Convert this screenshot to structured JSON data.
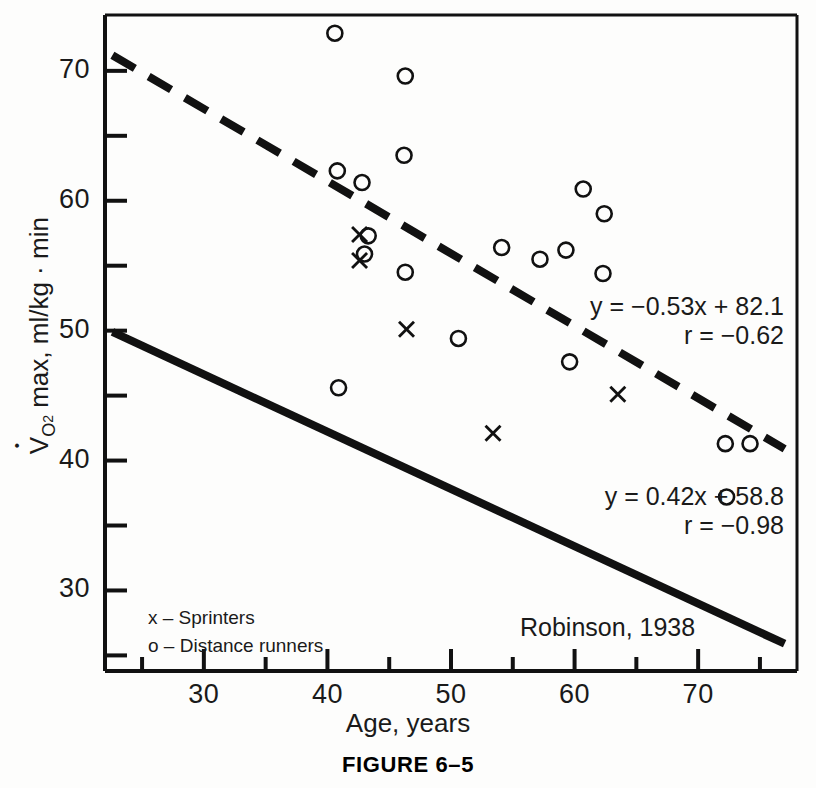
{
  "figure": {
    "caption": "FIGURE 6–5",
    "citation": "Robinson, 1938"
  },
  "chart_data": {
    "type": "scatter",
    "title": "",
    "xlabel": "Age, years",
    "ylabel": "V̇O2 max, ml/kg · min",
    "ylabel_parts": {
      "v": "V",
      "o2_sub": "O",
      "o2_sub_num": "2",
      "rest": " max, ml/kg · min"
    },
    "xlim": [
      22,
      78
    ],
    "ylim": [
      23.8,
      74.3
    ],
    "grid": false,
    "x_ticks_major": [
      30,
      40,
      50,
      60,
      70
    ],
    "x_ticks_minor": [
      25,
      35,
      45,
      55,
      65,
      75
    ],
    "x_tick_labels": [
      "30",
      "40",
      "50",
      "60",
      "70"
    ],
    "y_ticks_major": [
      30,
      40,
      50,
      60,
      70
    ],
    "y_ticks_minor": [
      25,
      35,
      45,
      55,
      65
    ],
    "y_tick_labels": [
      "30",
      "40",
      "50",
      "60",
      "70"
    ],
    "legend_position": "lower-left",
    "series": [
      {
        "name": "Sprinters",
        "marker": "x",
        "legend_label": "x – Sprinters",
        "points": [
          {
            "x": 42.6,
            "y": 57.4
          },
          {
            "x": 42.6,
            "y": 55.4
          },
          {
            "x": 46.4,
            "y": 50.1
          },
          {
            "x": 53.4,
            "y": 42.1
          },
          {
            "x": 63.5,
            "y": 45.1
          }
        ]
      },
      {
        "name": "Distance runners",
        "marker": "o",
        "legend_label": "o – Distance runners",
        "points": [
          {
            "x": 40.6,
            "y": 72.9
          },
          {
            "x": 46.3,
            "y": 69.6
          },
          {
            "x": 46.2,
            "y": 63.5
          },
          {
            "x": 40.8,
            "y": 62.3
          },
          {
            "x": 42.8,
            "y": 61.4
          },
          {
            "x": 43.3,
            "y": 57.3
          },
          {
            "x": 43.0,
            "y": 55.9
          },
          {
            "x": 46.3,
            "y": 54.5
          },
          {
            "x": 50.6,
            "y": 49.4
          },
          {
            "x": 54.1,
            "y": 56.4
          },
          {
            "x": 57.2,
            "y": 55.5
          },
          {
            "x": 59.3,
            "y": 56.2
          },
          {
            "x": 60.7,
            "y": 60.9
          },
          {
            "x": 62.4,
            "y": 59.0
          },
          {
            "x": 62.3,
            "y": 54.4
          },
          {
            "x": 59.6,
            "y": 47.6
          },
          {
            "x": 40.9,
            "y": 45.6
          },
          {
            "x": 72.2,
            "y": 41.3
          },
          {
            "x": 74.2,
            "y": 41.3
          },
          {
            "x": 72.3,
            "y": 37.2
          }
        ]
      }
    ],
    "fit_lines": [
      {
        "name": "distance-runners-fit",
        "style": "dashed",
        "equation": "y = −0.53x + 82.1",
        "correlation": "r = −0.62",
        "x_start": 22.6,
        "y_start": 71.2,
        "x_end": 77.0,
        "y_end": 40.9
      },
      {
        "name": "sprinters-fit",
        "style": "solid",
        "equation": "y = 0.42x + 58.8",
        "correlation": "r = −0.98",
        "x_start": 22.6,
        "y_start": 49.9,
        "x_end": 77.0,
        "y_end": 25.9
      }
    ]
  }
}
